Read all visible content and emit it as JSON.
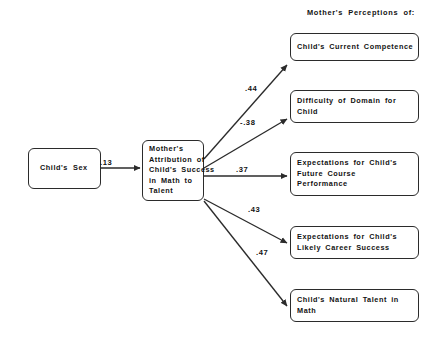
{
  "figure": {
    "type": "path-diagram",
    "header_label": "Mother's Perceptions of:",
    "background_color": "#ffffff",
    "line_color": "#2b2b2b",
    "text_color": "#121212"
  },
  "nodes": {
    "childs_sex": {
      "lines": [
        "Child's Sex"
      ]
    },
    "mothers_attribution": {
      "lines": [
        "Mother's",
        "Attribution of",
        "Child's Success",
        "in Math to",
        "Talent"
      ]
    },
    "current_competence": {
      "lines": [
        "Child's Current Competence"
      ]
    },
    "difficulty_of_domain": {
      "lines": [
        "Difficulty of Domain for",
        "Child"
      ]
    },
    "future_course_performance": {
      "lines": [
        "Expectations for Child's",
        "Future Course",
        "Performance"
      ]
    },
    "likely_career_success": {
      "lines": [
        "Expectations for Child's",
        "Likely Career Success"
      ]
    },
    "natural_talent": {
      "lines": [
        "Child's Natural Talent in",
        "Math"
      ]
    }
  },
  "edges": {
    "sex_to_attribution": {
      "coefficient": ".13"
    },
    "attribution_to_competence": {
      "coefficient": ".44"
    },
    "attribution_to_difficulty": {
      "coefficient": "-.38"
    },
    "attribution_to_course_performance": {
      "coefficient": ".37"
    },
    "attribution_to_career_success": {
      "coefficient": ".43"
    },
    "attribution_to_natural_talent": {
      "coefficient": ".47"
    }
  }
}
